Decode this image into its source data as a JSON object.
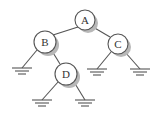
{
  "diagram": {
    "type": "binary-tree",
    "nodes": [
      {
        "id": "A",
        "label": "A",
        "cx": 85,
        "cy": 20,
        "r": 10
      },
      {
        "id": "B",
        "label": "B",
        "cx": 45,
        "cy": 42,
        "r": 11
      },
      {
        "id": "C",
        "label": "C",
        "cx": 118,
        "cy": 44,
        "r": 10
      },
      {
        "id": "D",
        "label": "D",
        "cx": 66,
        "cy": 74,
        "r": 11
      }
    ],
    "edges": [
      {
        "from": "A",
        "to": "B"
      },
      {
        "from": "A",
        "to": "C"
      },
      {
        "from": "B",
        "to": "null-B-left"
      },
      {
        "from": "B",
        "to": "D"
      },
      {
        "from": "C",
        "to": "null-C-left"
      },
      {
        "from": "C",
        "to": "null-C-right"
      },
      {
        "from": "D",
        "to": "null-D-left"
      },
      {
        "from": "D",
        "to": "null-D-right"
      }
    ],
    "null_markers": [
      {
        "id": "null-B-left",
        "x": 22,
        "y": 68
      },
      {
        "id": "null-C-left",
        "x": 97,
        "y": 69
      },
      {
        "id": "null-C-right",
        "x": 140,
        "y": 69
      },
      {
        "id": "null-D-left",
        "x": 42,
        "y": 100
      },
      {
        "id": "null-D-right",
        "x": 85,
        "y": 100
      }
    ]
  }
}
